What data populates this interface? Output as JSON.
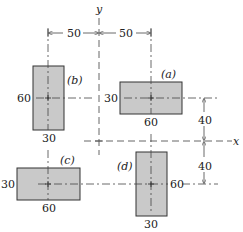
{
  "figure": {
    "axes": {
      "x_label": "x",
      "y_label": "y"
    },
    "colors": {
      "fill": "#c9c9c9",
      "stroke": "#333333",
      "line": "#444444"
    },
    "top_dimensions": [
      "50",
      "50"
    ],
    "right_dimensions": [
      "40",
      "40"
    ],
    "rectangles": [
      {
        "id": "a",
        "tag": "(a)",
        "width_label": "60",
        "height_label": "30"
      },
      {
        "id": "b",
        "tag": "(b)",
        "width_label": "30",
        "height_label": "60"
      },
      {
        "id": "c",
        "tag": "(c)",
        "width_label": "60",
        "height_label": "30"
      },
      {
        "id": "d",
        "tag": "(d)",
        "width_label": "30",
        "height_label": "60"
      }
    ]
  }
}
